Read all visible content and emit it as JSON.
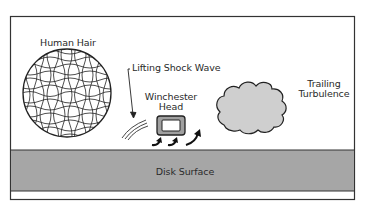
{
  "diagram": {
    "labels": {
      "human_hair": "Human Hair",
      "lifting_shock_wave": "Lifting Shock Wave",
      "winchester_head_line1": "Winchester",
      "winchester_head_line2": "Head",
      "trailing_turbulence_line1": "Trailing",
      "trailing_turbulence_line2": "Turbulence",
      "disk_surface": "Disk Surface"
    },
    "colors": {
      "frame": "#333333",
      "disk_surface_fill": "#a6a6a6",
      "head_fill": "#a0a0a0",
      "head_window": "#ffffff",
      "turbulence_fill": "#cfcfcf",
      "background": "#ffffff"
    }
  }
}
